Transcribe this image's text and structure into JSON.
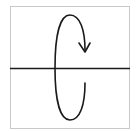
{
  "diagram": {
    "icon": "rotation-axis-icon",
    "colors": {
      "frame": "#c8c8c8",
      "stroke": "#1a1a1a",
      "background": "#ffffff"
    },
    "frame": {
      "x": 10.5,
      "y": 6.5,
      "width": 119,
      "height": 122
    },
    "axis": {
      "x1": 10,
      "y1": 68.5,
      "x2": 130,
      "y2": 68.5
    },
    "curve_path": "M85 83 C85 105 80 120 70 120 C60 120 55 100 55 68 C55 35 60 15 70 15 C80 15 85 30 85 50",
    "arrowhead_path": "M79 43 L85 52 L90 43"
  }
}
